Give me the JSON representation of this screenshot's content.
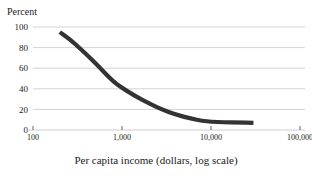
{
  "figure": {
    "title_fragment": "nd primary school completion",
    "background_color": "#ffffff",
    "text_color": "#1a1a1a"
  },
  "chart_data": {
    "type": "line",
    "title": "",
    "xlabel": "Per capita income (dollars, log scale)",
    "ylabel": "Percent",
    "x_scale": "log",
    "xlim": [
      100,
      100000
    ],
    "ylim": [
      0,
      100
    ],
    "grid": true,
    "legend": "none",
    "series_color": "#333333",
    "grid_color": "#c8c8c8",
    "axis_color": "#555555",
    "x_ticks": [
      100,
      1000,
      10000,
      100000
    ],
    "x_tick_labels": [
      "100",
      "1,000",
      "10,000",
      "100,000"
    ],
    "y_ticks": [
      0,
      20,
      40,
      60,
      80,
      100
    ],
    "y_tick_labels": [
      "0",
      "20",
      "40",
      "60",
      "80",
      "100"
    ],
    "series": [
      {
        "name": "Percent",
        "x": [
          200,
          260,
          340,
          450,
          600,
          800,
          1000,
          1400,
          2000,
          2800,
          4000,
          6000,
          8000,
          10000,
          14000,
          20000,
          30000
        ],
        "values": [
          95,
          88,
          79,
          69,
          58,
          47,
          41,
          33,
          26,
          20,
          15,
          11,
          9,
          8,
          7.5,
          7.2,
          7
        ]
      }
    ]
  }
}
